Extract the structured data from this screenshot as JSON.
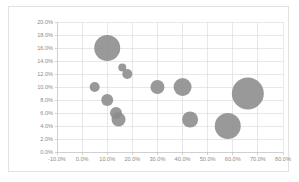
{
  "chart_data": {
    "type": "scatter",
    "subtype": "bubble",
    "title": "",
    "xlabel": "",
    "ylabel": "",
    "xlim": [
      -10,
      80
    ],
    "ylim": [
      0,
      20
    ],
    "grid": true,
    "legend": false,
    "legend_position": "none",
    "x_tick_labels": [
      "-10.0%",
      "0.0%",
      "10.0%",
      "20.0%",
      "30.0%",
      "40.0%",
      "50.0%",
      "60.0%",
      "70.0%",
      "80.0%"
    ],
    "x_ticks": [
      -10,
      0,
      10,
      20,
      30,
      40,
      50,
      60,
      70,
      80
    ],
    "y_tick_labels": [
      "0.0%",
      "2.0%",
      "4.0%",
      "6.0%",
      "8.0%",
      "10.0%",
      "12.0%",
      "14.0%",
      "16.0%",
      "18.0%",
      "20.0%"
    ],
    "y_ticks": [
      0,
      2,
      4,
      6,
      8,
      10,
      12,
      14,
      16,
      18,
      20
    ],
    "series_color": "#8b8b8b",
    "points": [
      {
        "x": 5,
        "y": 10,
        "size": 5
      },
      {
        "x": 10,
        "y": 16,
        "size": 13
      },
      {
        "x": 10,
        "y": 8,
        "size": 6
      },
      {
        "x": 13.5,
        "y": 6,
        "size": 6
      },
      {
        "x": 14.5,
        "y": 5,
        "size": 7
      },
      {
        "x": 16,
        "y": 13,
        "size": 4
      },
      {
        "x": 18,
        "y": 12,
        "size": 5
      },
      {
        "x": 30,
        "y": 10,
        "size": 7
      },
      {
        "x": 40,
        "y": 10,
        "size": 9
      },
      {
        "x": 43,
        "y": 5,
        "size": 8
      },
      {
        "x": 58,
        "y": 4,
        "size": 13
      },
      {
        "x": 66,
        "y": 9,
        "size": 16
      }
    ]
  },
  "plot_geometry": {
    "left": 57,
    "right": 283,
    "top": 22,
    "bottom": 152
  }
}
